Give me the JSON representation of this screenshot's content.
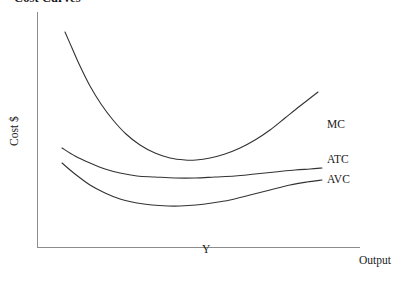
{
  "title": "Cost Curves",
  "axes": {
    "y_label": "Cost $",
    "x_label": "Output",
    "x_tick_label": "Y",
    "axis_color": "#8c8c8c"
  },
  "curve_labels": {
    "mc": "MC",
    "atc": "ATC",
    "avc": "AVC"
  },
  "chart_data": {
    "type": "line",
    "title": "Cost Curves",
    "xlabel": "Output",
    "ylabel": "Cost $",
    "grid": false,
    "legend": "inline-right-of-curve-ends",
    "annotations": [
      {
        "text": "Y",
        "x_px": 206,
        "y_px": 250,
        "note": "quantity marker on x-axis"
      }
    ],
    "axis_origin_px": {
      "x": 37,
      "y": 247
    },
    "axis_extent_px": {
      "x_end": 360,
      "y_top": 12
    },
    "series": [
      {
        "name": "MC",
        "label": "MC",
        "color": "#333333",
        "description": "Marginal cost: falls steeply from a high start, reaches a minimum, then rises sharply crossing AVC and ATC at their minima",
        "points_px": [
          [
            65,
            32
          ],
          [
            72,
            48
          ],
          [
            80,
            66
          ],
          [
            90,
            86
          ],
          [
            101,
            104
          ],
          [
            113,
            120
          ],
          [
            126,
            134
          ],
          [
            140,
            145
          ],
          [
            155,
            153
          ],
          [
            170,
            158
          ],
          [
            185,
            160
          ],
          [
            196,
            160
          ],
          [
            210,
            158
          ],
          [
            225,
            154
          ],
          [
            240,
            148
          ],
          [
            255,
            140
          ],
          [
            270,
            130
          ],
          [
            285,
            118
          ],
          [
            300,
            106
          ],
          [
            318,
            92
          ]
        ],
        "min_px": [
          195,
          160
        ],
        "start_px": [
          65,
          32
        ],
        "end_px": [
          318,
          92
        ]
      },
      {
        "name": "ATC",
        "label": "ATC",
        "color": "#333333",
        "description": "Average total cost: shallow U-shape, minimum near x=215, intersected from below by MC at its minimum",
        "points_px": [
          [
            62,
            148
          ],
          [
            75,
            156
          ],
          [
            90,
            163
          ],
          [
            105,
            169
          ],
          [
            120,
            173
          ],
          [
            137,
            176
          ],
          [
            155,
            177
          ],
          [
            175,
            178
          ],
          [
            195,
            178
          ],
          [
            215,
            177
          ],
          [
            235,
            176
          ],
          [
            255,
            174
          ],
          [
            275,
            172
          ],
          [
            295,
            170
          ],
          [
            310,
            169
          ],
          [
            322,
            168
          ]
        ],
        "min_px": [
          215,
          177
        ],
        "start_px": [
          62,
          148
        ],
        "end_px": [
          322,
          168
        ]
      },
      {
        "name": "AVC",
        "label": "AVC",
        "color": "#333333",
        "description": "Average variable cost: deeper U-shape, minimum near x=180, lies below ATC throughout and converges toward it at high output",
        "points_px": [
          [
            62,
            163
          ],
          [
            75,
            174
          ],
          [
            90,
            185
          ],
          [
            105,
            193
          ],
          [
            120,
            199
          ],
          [
            137,
            203
          ],
          [
            152,
            205
          ],
          [
            168,
            206
          ],
          [
            180,
            206
          ],
          [
            196,
            205
          ],
          [
            212,
            203
          ],
          [
            230,
            200
          ],
          [
            250,
            195
          ],
          [
            270,
            190
          ],
          [
            290,
            185
          ],
          [
            307,
            182
          ],
          [
            322,
            180
          ]
        ],
        "min_px": [
          180,
          206
        ],
        "start_px": [
          62,
          163
        ],
        "end_px": [
          322,
          180
        ]
      }
    ],
    "intersections_px": [
      {
        "curves": [
          "MC",
          "AVC"
        ],
        "x": 268,
        "y": 185
      },
      {
        "curves": [
          "MC",
          "ATC"
        ],
        "x": 280,
        "y": 173
      }
    ]
  }
}
